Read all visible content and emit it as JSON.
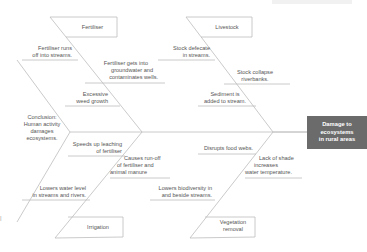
{
  "diagram": {
    "type": "fishbone",
    "effect": "Damage to ecosystems in rural areas",
    "conclusion": "Conclusion: Human activity damages ecosystems.",
    "categories": [
      {
        "name": "Fertiliser",
        "position": "top-left",
        "causes": [
          "Fertiliser runs off into streams.",
          "Fertiliser gets into groundwater and contaminates wells.",
          "Excessive weed growth"
        ]
      },
      {
        "name": "Livestock",
        "position": "top-right",
        "causes": [
          "Stock defecate in streams.",
          "Stock collapse riverbanks.",
          "Sediment is added to stream."
        ]
      },
      {
        "name": "Irrigation",
        "position": "bottom-left",
        "causes": [
          "Speeds up leaching of fertiliser",
          "Causes run-off of fertiliser and animal manure",
          "Lowers water level in streams and rivers."
        ]
      },
      {
        "name": "Vegetation removal",
        "position": "bottom-right",
        "causes": [
          "Disrupts food webs.",
          "Lack of shade increases water temperature.",
          "Lowers biodiversity in and beside streams."
        ]
      }
    ]
  },
  "labels": {
    "effect_l1": "Damage to",
    "effect_l2": "ecosystems",
    "effect_l3": "in rural areas",
    "concl_l1": "Conclusion:",
    "concl_l2": "Human activity",
    "concl_l3": "damages",
    "concl_l4": "ecosystems.",
    "fert": "Fertiliser",
    "fert_c1_l1": "Fertiliser runs",
    "fert_c1_l2": "off into streams.",
    "fert_c2_l1": "Fertiliser gets into",
    "fert_c2_l2": "groundwater and",
    "fert_c2_l3": "contaminates wells.",
    "fert_c3_l1": "Excessive",
    "fert_c3_l2": "weed growth",
    "live": "Livestock",
    "live_c1_l1": "Stock defecate",
    "live_c1_l2": "in streams.",
    "live_c2_l1": "Stock collapse",
    "live_c2_l2": "riverbanks.",
    "live_c3_l1": "Sediment is",
    "live_c3_l2": "added to stream.",
    "irr": "Irrigation",
    "irr_c1_l1": "Speeds up leaching",
    "irr_c1_l2": "of fertiliser",
    "irr_c2_l1": "Causes run-off",
    "irr_c2_l2": "of fertiliser and",
    "irr_c2_l3": "animal manure",
    "irr_c3_l1": "Lowers water level",
    "irr_c3_l2": "in streams and rivers.",
    "veg_l1": "Vegetation",
    "veg_l2": "removal",
    "veg_c1": "Disrupts food webs.",
    "veg_c2_l1": "Lack of shade",
    "veg_c2_l2": "increases",
    "veg_c2_l3": "water temperature.",
    "veg_c3_l1": "Lowers biodiversity in",
    "veg_c3_l2": "and beside streams."
  },
  "colors": {
    "line": "#bdbdbd",
    "text": "#555555",
    "effect_bg": "#6b6b6b",
    "effect_text": "#ffffff"
  }
}
